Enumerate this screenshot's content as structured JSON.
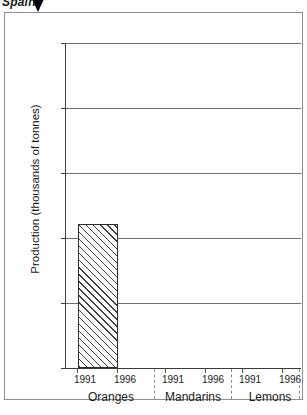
{
  "header": {
    "title": "Spain",
    "marker_icon": "down-triangle-icon"
  },
  "chart_data": {
    "type": "bar",
    "title": "Spain",
    "xlabel": "",
    "ylabel": "Production (thousands of tonnes)",
    "ylim": [
      0,
      250
    ],
    "yticks": [
      0,
      50,
      100,
      150,
      200,
      250
    ],
    "ytick_labels": [
      "0",
      "50",
      "100",
      "150",
      "200",
      "250"
    ],
    "grid": true,
    "legend": "none",
    "groups": [
      "Oranges",
      "Mandarins",
      "Lemons"
    ],
    "categories": [
      "1991",
      "1996"
    ],
    "series": [
      {
        "name": "Oranges",
        "categories": [
          "1991",
          "1996"
        ],
        "values": [
          111,
          null
        ]
      },
      {
        "name": "Mandarins",
        "categories": [
          "1991",
          "1996"
        ],
        "values": [
          null,
          null
        ]
      },
      {
        "name": "Lemons",
        "categories": [
          "1991",
          "1996"
        ],
        "values": [
          null,
          null
        ]
      }
    ],
    "bar_style": "diagonal-hatch"
  },
  "axis": {
    "y_title": "Production (thousands of tonnes)",
    "y_labels": {
      "t0": "0",
      "t1": "50",
      "t2": "100",
      "t3": "150",
      "t4": "200",
      "t5": "250"
    },
    "x_labels": {
      "oranges_1991": "1991",
      "oranges_1996": "1996",
      "mandarins_1991": "1991",
      "mandarins_1996": "1996",
      "lemons_1991": "1991",
      "lemons_1996": "1996"
    },
    "group_labels": {
      "g0": "Oranges",
      "g1": "Mandarins",
      "g2": "Lemons"
    }
  },
  "colors": {
    "axis": "#3a3a3a",
    "grid": "#6f6f6f",
    "bar_outline": "#2b2b2b",
    "hatch": "#3d3d3d",
    "frame": "#8e8e8e",
    "background": "#ffffff"
  }
}
